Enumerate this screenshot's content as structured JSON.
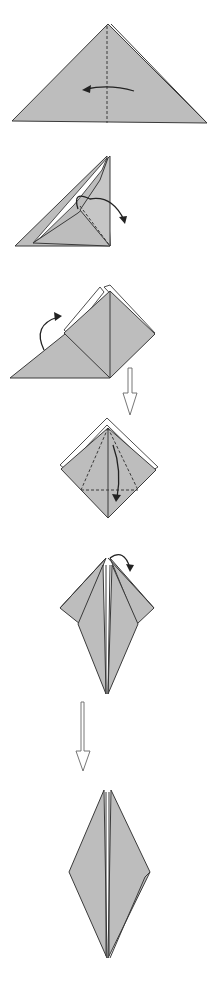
{
  "diagram": {
    "type": "origami-instructions",
    "colors": {
      "paper": "#bdbdbd",
      "outline": "#3a3a3a",
      "background": "#ffffff"
    },
    "steps": [
      {
        "id": 1,
        "shape": "triangle",
        "action": "fold-in-half-left",
        "fold": "valley-vertical"
      },
      {
        "id": 2,
        "shape": "triangle-open-pocket",
        "action": "squash-fold-right",
        "fold": "valley-diagonal"
      },
      {
        "id": 3,
        "shape": "square-on-triangle",
        "action": "repeat-behind",
        "fold": "none"
      },
      {
        "id": 4,
        "shape": "square-base",
        "action": "kite-folds-and-petal-fold",
        "fold": "valley-kite-and-horizontal"
      },
      {
        "id": 5,
        "shape": "bird-base-partial",
        "action": "repeat-behind",
        "fold": "none"
      },
      {
        "id": 6,
        "shape": "bird-base",
        "action": "result",
        "fold": "none"
      }
    ],
    "transitions": [
      {
        "from": 3,
        "to": 4,
        "icon": "hollow-down-arrow"
      },
      {
        "from": 5,
        "to": 6,
        "icon": "hollow-down-arrow"
      }
    ]
  }
}
